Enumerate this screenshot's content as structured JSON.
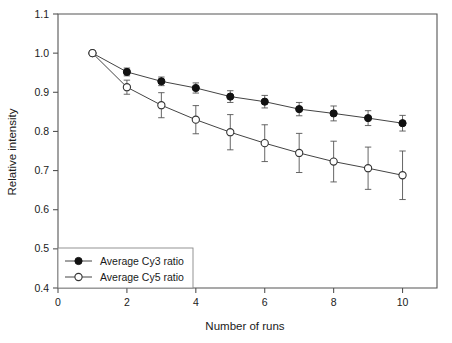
{
  "chart_data": {
    "type": "line",
    "title": "",
    "xlabel": "Number of runs",
    "ylabel": "Relative intensity",
    "xlim": [
      0,
      11
    ],
    "ylim": [
      0.4,
      1.1
    ],
    "xticks": [
      0,
      2,
      4,
      6,
      8,
      10
    ],
    "xtick_labels": [
      "0",
      "2",
      "4",
      "6",
      "8",
      "10"
    ],
    "yticks": [
      0.4,
      0.5,
      0.6,
      0.7,
      0.8,
      0.9,
      1.0,
      1.1
    ],
    "ytick_labels": [
      "0.4",
      "0.5",
      "0.6",
      "0.7",
      "0.8",
      "0.9",
      "1.0",
      "1.1"
    ],
    "grid": false,
    "legend_position": "lower left",
    "x": [
      1,
      2,
      3,
      4,
      5,
      6,
      7,
      8,
      9,
      10
    ],
    "series": [
      {
        "name": "Average Cy3  ratio",
        "marker": "filled-circle",
        "values": [
          1.0,
          0.952,
          0.928,
          0.911,
          0.889,
          0.876,
          0.857,
          0.846,
          0.834,
          0.821
        ],
        "errors": [
          0.0,
          0.01,
          0.011,
          0.013,
          0.015,
          0.016,
          0.017,
          0.019,
          0.019,
          0.02
        ]
      },
      {
        "name": "Average Cy5  ratio",
        "marker": "open-circle",
        "values": [
          1.0,
          0.913,
          0.867,
          0.83,
          0.798,
          0.77,
          0.745,
          0.723,
          0.706,
          0.688
        ],
        "errors": [
          0.0,
          0.018,
          0.032,
          0.036,
          0.045,
          0.047,
          0.05,
          0.052,
          0.054,
          0.062
        ]
      }
    ]
  },
  "axes": {
    "xlabel": "Number of runs",
    "ylabel": "Relative intensity"
  },
  "legend": {
    "entries": [
      {
        "label": "Average Cy3  ratio",
        "marker": "filled-circle"
      },
      {
        "label": "Average Cy5  ratio",
        "marker": "open-circle"
      }
    ]
  },
  "colors": {
    "axis": "#555555",
    "line": "#444444",
    "marker_filled": "#111111",
    "marker_open_fill": "#ffffff",
    "background": "#ffffff"
  }
}
